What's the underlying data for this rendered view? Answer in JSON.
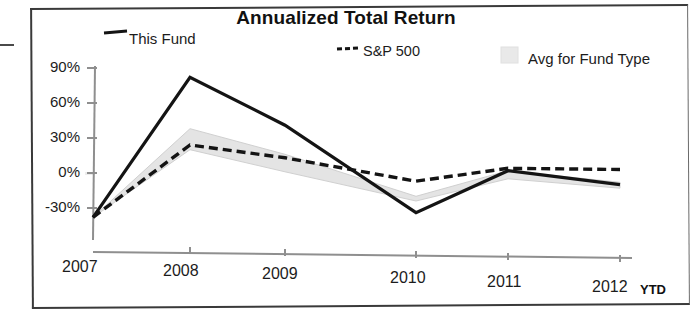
{
  "chart_data": {
    "type": "line",
    "title": "Annualized Total Return",
    "xlabel": "",
    "ylabel": "",
    "categories": [
      "2007",
      "2008",
      "2009",
      "2010",
      "2011",
      "2012"
    ],
    "x_axis_suffix": "YTD",
    "ylim": [
      -45,
      90
    ],
    "yticks": [
      -30,
      0,
      30,
      60,
      90
    ],
    "ytick_labels": [
      "-30%",
      "0%",
      "30%",
      "60%",
      "90%"
    ],
    "grid": false,
    "legend_position": "top",
    "series": [
      {
        "name": "This Fund",
        "style": "solid",
        "color": "#141414",
        "values": [
          -38,
          82,
          41,
          -34,
          2,
          -10
        ]
      },
      {
        "name": "S&P 500",
        "style": "dashed",
        "color": "#141414",
        "values": [
          -38,
          24,
          13,
          -7,
          4,
          3
        ]
      },
      {
        "name": "Avg for Fund Type",
        "style": "band",
        "color": "#e4e4e4",
        "upper": [
          -38,
          38,
          16,
          -20,
          2,
          -8
        ],
        "lower": [
          -38,
          20,
          1,
          -24,
          -5,
          -13
        ]
      }
    ]
  },
  "title": "Annualized Total Return",
  "legend": {
    "fund": "This Fund",
    "sp500": "S&P 500",
    "avg": "Avg for Fund Type"
  },
  "y_axis": {
    "t90": "90%",
    "t60": "60%",
    "t30": "30%",
    "t0": "0%",
    "tm30": "-30%"
  },
  "x_axis": {
    "y2007": "2007",
    "y2008": "2008",
    "y2009": "2009",
    "y2010": "2010",
    "y2011": "2011",
    "y2012": "2012",
    "ytd": "YTD"
  },
  "colors": {
    "fund_line": "#141414",
    "sp_line": "#141414",
    "band_fill": "#e6e6e6",
    "axis": "#8a8a8a",
    "frame": "#3a3a3a"
  }
}
